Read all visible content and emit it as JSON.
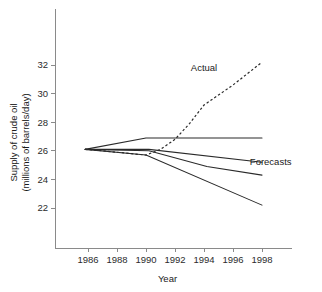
{
  "chart_data": {
    "type": "line",
    "title": "",
    "xlabel": "Year",
    "ylabel": "Supply of crude oil\n(millions of barrels/day)",
    "ylabel_line1": "Supply of crude oil",
    "ylabel_line2": "(millions of barrels/day)",
    "xlim": [
      1984.8,
      1999.5
    ],
    "ylim": [
      20.8,
      33.5
    ],
    "xticks": [
      1986,
      1988,
      1990,
      1992,
      1994,
      1996,
      1998
    ],
    "xticklabels": [
      "1986",
      "1988",
      "1990",
      "1992",
      "1994",
      "1996",
      "1998"
    ],
    "yticks": [
      22,
      24,
      26,
      28,
      30,
      32
    ],
    "yticklabels": [
      "22",
      "24",
      "26",
      "28",
      "30",
      "32"
    ],
    "grid": false,
    "legend": "inline-annotations",
    "annotations": [
      {
        "text": "Actual",
        "x": 1994.0,
        "y": 31.6
      },
      {
        "text": "Forecasts",
        "x": 1998.6,
        "y": 25.0
      }
    ],
    "series": [
      {
        "name": "Actual",
        "style": "dashed",
        "x": [
          1985.8,
          1987.0,
          1988.0,
          1989.0,
          1990.0,
          1991.0,
          1992.0,
          1993.0,
          1994.0,
          1995.0,
          1996.0,
          1997.0,
          1998.0
        ],
        "y": [
          26.1,
          26.0,
          25.9,
          25.8,
          25.7,
          26.1,
          26.8,
          27.9,
          29.2,
          29.9,
          30.6,
          31.4,
          32.2
        ]
      },
      {
        "name": "Forecast 1",
        "style": "solid",
        "x": [
          1985.8,
          1990.0,
          1998.0
        ],
        "y": [
          26.1,
          26.9,
          26.9
        ]
      },
      {
        "name": "Forecast 2",
        "style": "solid",
        "x": [
          1985.8,
          1990.2,
          1998.0
        ],
        "y": [
          26.1,
          26.1,
          25.2
        ]
      },
      {
        "name": "Forecast 3",
        "style": "solid",
        "x": [
          1985.8,
          1990.2,
          1994.2,
          1998.0
        ],
        "y": [
          26.1,
          26.0,
          24.9,
          24.3
        ]
      },
      {
        "name": "Forecast 4",
        "style": "solid",
        "x": [
          1985.8,
          1990.0,
          1998.0
        ],
        "y": [
          26.1,
          25.7,
          22.2
        ]
      }
    ]
  }
}
